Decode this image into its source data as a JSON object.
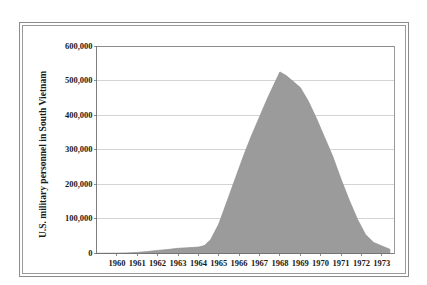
{
  "chart_data": {
    "type": "area",
    "title": "",
    "xlabel": "",
    "ylabel": "U.S. military personnel in South Vietnam",
    "xlim": [
      1959,
      1973.6
    ],
    "ylim": [
      0,
      600000
    ],
    "grid": true,
    "legend": null,
    "fill_color": "#9b9b9b",
    "line_color": "#8f8f8f",
    "gridline_color": "#c9c9c9",
    "axis_color": "#6f6f6f",
    "x_tick_labels": [
      "1960",
      "1961",
      "1962",
      "1963",
      "1964",
      "1965",
      "1966",
      "1967",
      "1968",
      "1969",
      "1970",
      "1971",
      "1972",
      "1973"
    ],
    "y_tick_labels": [
      "600,000",
      "500,000",
      "400,000",
      "300,000",
      "200,000",
      "100,000",
      "0"
    ],
    "y_tick_values": [
      600000,
      500000,
      400000,
      300000,
      200000,
      100000,
      0
    ],
    "x": [
      1959.0,
      1959.5,
      1960.0,
      1960.5,
      1961.0,
      1961.5,
      1962.0,
      1962.5,
      1963.0,
      1963.5,
      1964.0,
      1964.3,
      1964.6,
      1965.0,
      1965.4,
      1965.8,
      1966.2,
      1966.6,
      1967.0,
      1967.4,
      1967.8,
      1968.0,
      1968.3,
      1968.6,
      1969.0,
      1969.4,
      1969.8,
      1970.2,
      1970.6,
      1971.0,
      1971.4,
      1971.8,
      1972.2,
      1972.6,
      1973.0,
      1973.4
    ],
    "y": [
      760,
      900,
      1100,
      1800,
      3200,
      5600,
      9000,
      11500,
      15000,
      16800,
      18500,
      23000,
      40000,
      85000,
      150000,
      215000,
      280000,
      340000,
      395000,
      450000,
      500000,
      525000,
      515000,
      500000,
      480000,
      440000,
      390000,
      335000,
      280000,
      215000,
      155000,
      100000,
      55000,
      32000,
      22000,
      12000
    ],
    "annotations": []
  },
  "axis": {
    "y_title": "U.S. military personnel in South Vietnam"
  }
}
